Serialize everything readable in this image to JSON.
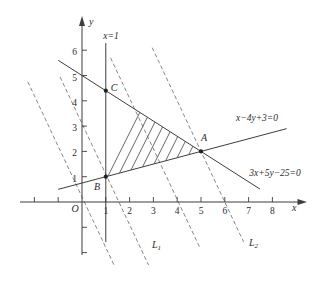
{
  "figure": {
    "background": "#ffffff",
    "ink": "#3d3d3d",
    "dash_color": "#787878",
    "hatch_color": "#555555",
    "text_color": "#2b2b2b"
  },
  "chart_data": {
    "type": "line",
    "xlabel": "x",
    "ylabel": "y",
    "origin_label": "O",
    "xlim": [
      -2.6,
      9.5
    ],
    "ylim": [
      -2.1,
      7.3
    ],
    "grid": false,
    "x_ticks": [
      1,
      2,
      3,
      4,
      5,
      6,
      7,
      8
    ],
    "y_ticks": [
      1,
      2,
      3,
      4,
      5,
      6
    ],
    "x_ticks_unlabeled": [
      -2,
      -1
    ],
    "y_ticks_unlabeled": [
      -1,
      -2
    ],
    "boundary_lines": [
      {
        "equation": "x=1",
        "style": "solid",
        "segment": [
          [
            1,
            6.28
          ],
          [
            1,
            -1.58
          ]
        ]
      },
      {
        "equation": "x−4y+3=0",
        "style": "solid",
        "segment": [
          [
            -1.0,
            0.5
          ],
          [
            8.6,
            2.9
          ]
        ]
      },
      {
        "equation": "3x+5y−25=0",
        "style": "solid",
        "segment": [
          [
            -1.0,
            5.6
          ],
          [
            7.48,
            0.51
          ]
        ]
      }
    ],
    "objective_lines": {
      "style": "dashed",
      "slope": -2,
      "lines": [
        {
          "x_intercept": 0.1,
          "y_top": 4.75,
          "y_bottom": -2.57,
          "label": "",
          "label_sub": ""
        },
        {
          "x_intercept": 1.55,
          "y_top": 4.94,
          "y_bottom": -2.49,
          "label": "L",
          "label_sub": "1"
        },
        {
          "x_intercept": 4.05,
          "y_top": 5.7,
          "y_bottom": -1.78,
          "label": "",
          "label_sub": ""
        },
        {
          "x_intercept": 6.0,
          "y_top": 6.1,
          "y_bottom": -1.58,
          "label": "L",
          "label_sub": "2"
        }
      ]
    },
    "points": [
      {
        "label": "A",
        "x": 5,
        "y": 2
      },
      {
        "label": "B",
        "x": 1,
        "y": 1
      },
      {
        "label": "C",
        "x": 1,
        "y": 4.4
      }
    ],
    "feasible_region": {
      "vertices": [
        [
          1,
          1
        ],
        [
          1,
          4.4
        ],
        [
          5,
          2
        ]
      ],
      "fill": "hatched"
    }
  }
}
